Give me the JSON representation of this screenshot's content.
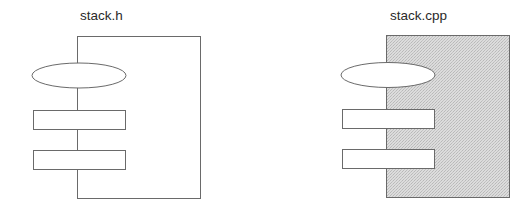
{
  "diagram": {
    "modules": [
      {
        "id": "header",
        "title": "stack.h",
        "fill": "#ffffff",
        "shaded": false,
        "box": {
          "x": 77,
          "y": 36,
          "width": 123,
          "height": 162
        },
        "interface_elements": [
          {
            "type": "ellipse",
            "cx": 79,
            "cy": 75.5,
            "rx": 47,
            "ry": 12.5
          },
          {
            "type": "rect",
            "x": 33,
            "y": 110,
            "width": 92,
            "height": 19
          },
          {
            "type": "rect",
            "x": 33,
            "y": 150,
            "width": 92,
            "height": 19
          }
        ]
      },
      {
        "id": "implementation",
        "title": "stack.cpp",
        "fill": "#d9d9d9",
        "shaded": true,
        "box": {
          "x": 386,
          "y": 35,
          "width": 123,
          "height": 162
        },
        "interface_elements": [
          {
            "type": "ellipse",
            "cx": 388,
            "cy": 75,
            "rx": 47,
            "ry": 12.5
          },
          {
            "type": "rect",
            "x": 342,
            "y": 109,
            "width": 92,
            "height": 19
          },
          {
            "type": "rect",
            "x": 342,
            "y": 149,
            "width": 92,
            "height": 19
          }
        ]
      }
    ],
    "colors": {
      "stroke": "#6a6a6a",
      "text": "#2a2a2a",
      "shade": "#d9d9d9",
      "shade_dot": "#bdbdbd",
      "background": "#ffffff"
    }
  }
}
